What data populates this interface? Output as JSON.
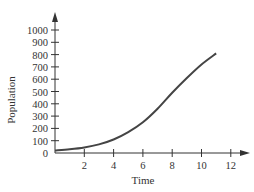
{
  "chart_data": {
    "type": "line",
    "title": "",
    "xlabel": "Time",
    "ylabel": "Population",
    "xlim": [
      0,
      13
    ],
    "ylim": [
      0,
      1100
    ],
    "xticks": [
      2,
      4,
      6,
      8,
      10,
      12
    ],
    "yticks": [
      0,
      100,
      200,
      300,
      400,
      500,
      600,
      700,
      800,
      900,
      1000
    ],
    "grid": false,
    "legend": null,
    "series": [
      {
        "name": "Population",
        "x": [
          0,
          1,
          2,
          3,
          4,
          5,
          6,
          7,
          8,
          9,
          10,
          11
        ],
        "values": [
          20,
          30,
          45,
          70,
          110,
          170,
          250,
          360,
          490,
          610,
          720,
          810
        ]
      }
    ]
  },
  "colors": {
    "axis": "#333333",
    "line": "#444444"
  }
}
